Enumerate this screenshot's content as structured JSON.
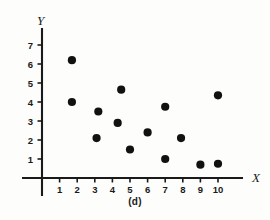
{
  "figure": {
    "caption": "(d)",
    "background_color": "#fdfdfc",
    "ink_color": "#111111"
  },
  "chart_data": {
    "type": "scatter",
    "title": "",
    "subtitle": "",
    "xlabel": "X",
    "ylabel": "Y",
    "xlim": [
      0,
      11
    ],
    "ylim": [
      0,
      7.8
    ],
    "grid": false,
    "legend": null,
    "xticks": [
      1,
      2,
      3,
      4,
      5,
      6,
      7,
      8,
      9,
      10
    ],
    "xtick_labels": [
      "1",
      "2",
      "3",
      "4",
      "5",
      "6",
      "7",
      "8",
      "9",
      "10"
    ],
    "yticks": [
      1,
      2,
      3,
      4,
      5,
      6,
      7
    ],
    "ytick_labels": [
      "1",
      "2",
      "3",
      "4",
      "5",
      "6",
      "7"
    ],
    "marker": "filled-circle",
    "marker_color": "#111111",
    "marker_size_px": 5,
    "x": [
      1.7,
      1.7,
      3.2,
      3.1,
      4.3,
      4.5,
      5.0,
      6.0,
      7.0,
      7.0,
      7.9,
      9.0,
      10.0,
      10.0
    ],
    "y": [
      6.2,
      4.0,
      3.5,
      2.1,
      2.9,
      4.65,
      1.5,
      2.4,
      3.75,
      1.0,
      2.1,
      0.7,
      4.35,
      0.75
    ],
    "points": [
      {
        "x": 1.7,
        "y": 6.2
      },
      {
        "x": 1.7,
        "y": 4.0
      },
      {
        "x": 3.2,
        "y": 3.5
      },
      {
        "x": 3.1,
        "y": 2.1
      },
      {
        "x": 4.3,
        "y": 2.9
      },
      {
        "x": 4.5,
        "y": 4.65
      },
      {
        "x": 5.0,
        "y": 1.5
      },
      {
        "x": 6.0,
        "y": 2.4
      },
      {
        "x": 7.0,
        "y": 3.75
      },
      {
        "x": 7.0,
        "y": 1.0
      },
      {
        "x": 7.9,
        "y": 2.1
      },
      {
        "x": 9.0,
        "y": 0.7
      },
      {
        "x": 10.0,
        "y": 4.35
      },
      {
        "x": 10.0,
        "y": 0.75
      }
    ]
  }
}
